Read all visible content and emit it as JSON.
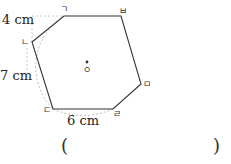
{
  "figure": {
    "labels": {
      "side_top_left": "4 cm",
      "side_left": "7 cm",
      "side_bottom": "6 cm"
    },
    "vertices": [
      "ㄱ",
      "ㅂ",
      "ㅁ",
      "ㄹ",
      "ㄷ",
      "ㄴ"
    ],
    "center": "ㅇ"
  },
  "answer": {
    "open_paren": "(",
    "close_paren": ")"
  }
}
